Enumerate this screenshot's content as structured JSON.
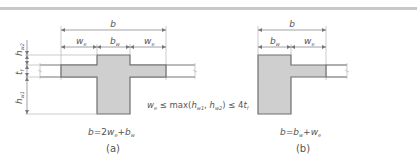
{
  "figure": {
    "top_band_color": "#c8c8c8",
    "shade_color": "#cfcfcf",
    "line_color": "#777777",
    "text_color": "#555555",
    "panel_a": {
      "caption": "(a)",
      "formula": {
        "b": "b",
        "eq": "=2",
        "we": "w",
        "we_sub": "e",
        "plus": "+",
        "bw": "b",
        "bw_sub": "w"
      },
      "dimensions": {
        "overall": "b",
        "left_flange": {
          "main": "w",
          "sub": "e"
        },
        "web": {
          "main": "b",
          "sub": "w"
        },
        "right_flange": {
          "main": "w",
          "sub": "e"
        }
      },
      "vertical_dimensions": {
        "top": {
          "main": "h",
          "sub": "w2"
        },
        "flange": {
          "main": "t",
          "sub": "f"
        },
        "bottom": {
          "main": "h",
          "sub": "w1"
        }
      }
    },
    "constraint": {
      "we": "w",
      "we_sub": "e",
      "le1": " ≤ max(",
      "hw1": "h",
      "hw1_sub": "w1",
      "comma": ", ",
      "hw2": "h",
      "hw2_sub": "w2",
      "le2": ") ≤ 4",
      "tf": "t",
      "tf_sub": "f"
    },
    "panel_b": {
      "caption": "(b)",
      "formula": {
        "b": "b",
        "eq": "=",
        "bw": "b",
        "bw_sub": "w",
        "plus": "+",
        "we": "w",
        "we_sub": "e"
      },
      "dimensions": {
        "overall": "b",
        "web": {
          "main": "b",
          "sub": "w"
        },
        "flange": {
          "main": "w",
          "sub": "e"
        }
      }
    }
  }
}
